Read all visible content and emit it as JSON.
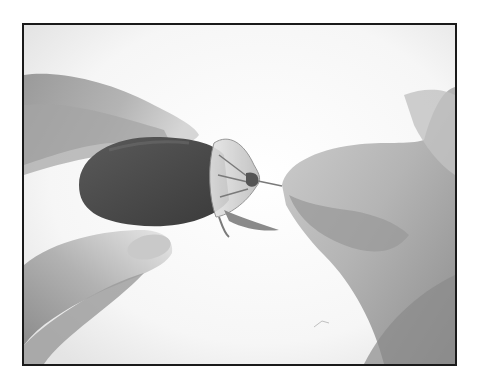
{
  "photo": {
    "subject": "hands threading a wire through a fabric rose bud",
    "style": "grayscale halftone photograph with black border",
    "colors": {
      "border": "#1a1a1a",
      "background": "#fdfdfd",
      "skin_light": "#c8c8c8",
      "skin_mid": "#a8a8a8",
      "skin_dark": "#8a8a8a",
      "bud": "#4a4a4a",
      "sepal": "#d8d8d8"
    }
  }
}
